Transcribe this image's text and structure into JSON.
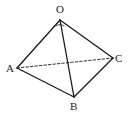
{
  "diagram": {
    "vertices": [
      {
        "id": "O",
        "label": "O"
      },
      {
        "id": "A",
        "label": "A"
      },
      {
        "id": "B",
        "label": "B"
      },
      {
        "id": "C",
        "label": "C"
      }
    ],
    "edges": [
      {
        "from": "O",
        "to": "A",
        "style": "solid"
      },
      {
        "from": "O",
        "to": "B",
        "style": "solid"
      },
      {
        "from": "O",
        "to": "C",
        "style": "solid"
      },
      {
        "from": "A",
        "to": "B",
        "style": "solid"
      },
      {
        "from": "B",
        "to": "C",
        "style": "solid"
      },
      {
        "from": "A",
        "to": "C",
        "style": "dashed"
      }
    ],
    "colors": {
      "line": "#1a1a1a",
      "background": "#ffffff"
    }
  }
}
